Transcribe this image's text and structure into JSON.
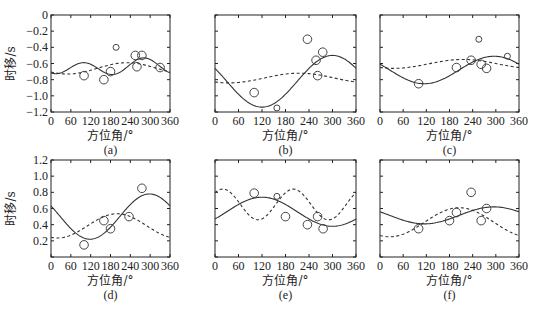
{
  "chart_data": [
    {
      "id": "a",
      "type": "scatter",
      "panel_label": "(a)",
      "xlabel": "方位角/°",
      "ylabel": "时移/s",
      "xlim": [
        0,
        360
      ],
      "ylim": [
        -1.2,
        0
      ],
      "xticks": [
        0,
        60,
        120,
        180,
        240,
        300,
        360
      ],
      "xtick_labels": [
        "0",
        "60",
        "120",
        "180",
        "240",
        "300",
        "360"
      ],
      "yticks": [
        0,
        -0.2,
        -0.4,
        -0.6,
        -0.8,
        -1.0,
        -1.2
      ],
      "ytick_labels": [
        "0",
        "-0.2",
        "-0.4",
        "-0.6",
        "-0.8",
        "-1.0",
        "-1.2"
      ],
      "show_ylabel": true,
      "show_yticklabels": true,
      "points": [
        {
          "x": 100,
          "y": -0.75,
          "size": "large"
        },
        {
          "x": 160,
          "y": -0.8,
          "size": "large"
        },
        {
          "x": 180,
          "y": -0.7,
          "size": "large"
        },
        {
          "x": 197,
          "y": -0.4,
          "size": "small"
        },
        {
          "x": 255,
          "y": -0.5,
          "size": "large"
        },
        {
          "x": 260,
          "y": -0.64,
          "size": "large"
        },
        {
          "x": 275,
          "y": -0.5,
          "size": "large"
        },
        {
          "x": 330,
          "y": -0.65,
          "size": "large"
        }
      ],
      "solid_curve": {
        "offset": -0.645,
        "amp": 0.085,
        "phase_deg": 280,
        "period_deg": 180,
        "amp2": 0.03,
        "phase2_deg": 290
      },
      "dashed_curve": {
        "offset": -0.66,
        "amp": 0.07,
        "phase_deg": 230,
        "period_deg": 360
      }
    },
    {
      "id": "b",
      "type": "scatter",
      "panel_label": "(b)",
      "xlabel": "方位角/°",
      "ylabel": "时移/s",
      "xlim": [
        0,
        360
      ],
      "ylim": [
        -1.2,
        0
      ],
      "xticks": [
        0,
        60,
        120,
        180,
        240,
        300,
        360
      ],
      "xtick_labels": [
        "0",
        "60",
        "120",
        "180",
        "240",
        "300",
        "360"
      ],
      "yticks": [
        0,
        -0.2,
        -0.4,
        -0.6,
        -0.8,
        -1.0,
        -1.2
      ],
      "ytick_labels": [],
      "show_ylabel": false,
      "show_yticklabels": false,
      "points": [
        {
          "x": 100,
          "y": -0.96,
          "size": "large"
        },
        {
          "x": 158,
          "y": -1.15,
          "size": "small"
        },
        {
          "x": 236,
          "y": -0.3,
          "size": "large"
        },
        {
          "x": 258,
          "y": -0.56,
          "size": "large"
        },
        {
          "x": 262,
          "y": -0.75,
          "size": "large"
        },
        {
          "x": 275,
          "y": -0.46,
          "size": "large"
        }
      ],
      "solid_curve": {
        "offset": -0.82,
        "amp": 0.32,
        "phase_deg": 300,
        "period_deg": 360
      },
      "dashed_curve": {
        "offset": -0.78,
        "amp": 0.06,
        "phase_deg": 215,
        "period_deg": 360
      }
    },
    {
      "id": "c",
      "type": "scatter",
      "panel_label": "(c)",
      "xlabel": "方位角/°",
      "ylabel": "时移/s",
      "xlim": [
        0,
        360
      ],
      "ylim": [
        -1.2,
        0
      ],
      "xticks": [
        0,
        60,
        120,
        180,
        240,
        300,
        360
      ],
      "xtick_labels": [
        "0",
        "60",
        "120",
        "180",
        "240",
        "300",
        "360"
      ],
      "yticks": [
        0,
        -0.2,
        -0.4,
        -0.6,
        -0.8,
        -1.0,
        -1.2
      ],
      "ytick_labels": [],
      "show_ylabel": false,
      "show_yticklabels": false,
      "points": [
        {
          "x": 100,
          "y": -0.85,
          "size": "large"
        },
        {
          "x": 198,
          "y": -0.65,
          "size": "large"
        },
        {
          "x": 236,
          "y": -0.56,
          "size": "large"
        },
        {
          "x": 256,
          "y": -0.3,
          "size": "small"
        },
        {
          "x": 262,
          "y": -0.61,
          "size": "large"
        },
        {
          "x": 276,
          "y": -0.66,
          "size": "large"
        },
        {
          "x": 330,
          "y": -0.51,
          "size": "small"
        }
      ],
      "solid_curve": {
        "offset": -0.68,
        "amp": 0.17,
        "phase_deg": 295,
        "period_deg": 360
      },
      "dashed_curve": {
        "offset": -0.605,
        "amp": 0.055,
        "phase_deg": 215,
        "period_deg": 360
      }
    },
    {
      "id": "d",
      "type": "scatter",
      "panel_label": "(d)",
      "xlabel": "方位角/°",
      "ylabel": "时移/s",
      "xlim": [
        0,
        360
      ],
      "ylim": [
        0,
        1.2
      ],
      "xticks": [
        0,
        60,
        120,
        180,
        240,
        300,
        360
      ],
      "xtick_labels": [
        "0",
        "60",
        "120",
        "180",
        "240",
        "300",
        "360"
      ],
      "yticks": [
        0,
        0.2,
        0.4,
        0.6,
        0.8,
        1.0,
        1.2
      ],
      "ytick_labels": [
        "",
        "0.2",
        "0.4",
        "0.6",
        "0.8",
        "1.0",
        "1.2"
      ],
      "show_ylabel": true,
      "show_yticklabels": true,
      "points": [
        {
          "x": 100,
          "y": 0.15,
          "size": "large"
        },
        {
          "x": 160,
          "y": 0.45,
          "size": "large"
        },
        {
          "x": 180,
          "y": 0.35,
          "size": "large"
        },
        {
          "x": 236,
          "y": 0.5,
          "size": "large"
        },
        {
          "x": 275,
          "y": 0.85,
          "size": "large"
        }
      ],
      "solid_curve": {
        "offset": 0.5,
        "amp": 0.28,
        "phase_deg": 298,
        "period_deg": 360
      },
      "dashed_curve": {
        "offset": 0.385,
        "amp": 0.15,
        "phase_deg": 200,
        "period_deg": 360
      }
    },
    {
      "id": "e",
      "type": "scatter",
      "panel_label": "(e)",
      "xlabel": "方位角/°",
      "ylabel": "时移/s",
      "xlim": [
        0,
        360
      ],
      "ylim": [
        0,
        1.2
      ],
      "xticks": [
        0,
        60,
        120,
        180,
        240,
        300,
        360
      ],
      "xtick_labels": [
        "0",
        "60",
        "120",
        "180",
        "240",
        "300",
        "360"
      ],
      "yticks": [
        0,
        0.2,
        0.4,
        0.6,
        0.8,
        1.0,
        1.2
      ],
      "ytick_labels": [],
      "show_ylabel": false,
      "show_yticklabels": false,
      "points": [
        {
          "x": 100,
          "y": 0.79,
          "size": "large"
        },
        {
          "x": 158,
          "y": 0.75,
          "size": "small"
        },
        {
          "x": 180,
          "y": 0.5,
          "size": "large"
        },
        {
          "x": 236,
          "y": 0.4,
          "size": "large"
        },
        {
          "x": 262,
          "y": 0.5,
          "size": "large"
        },
        {
          "x": 276,
          "y": 0.35,
          "size": "large"
        }
      ],
      "solid_curve": {
        "offset": 0.56,
        "amp": 0.18,
        "phase_deg": 120,
        "period_deg": 360
      },
      "dashed_curve": {
        "offset": 0.65,
        "amp": 0.19,
        "phase_deg": 20,
        "period_deg": 180
      }
    },
    {
      "id": "f",
      "type": "scatter",
      "panel_label": "(f)",
      "xlabel": "方位角/°",
      "ylabel": "时移/s",
      "xlim": [
        0,
        360
      ],
      "ylim": [
        0,
        1.2
      ],
      "xticks": [
        0,
        60,
        120,
        180,
        240,
        300,
        360
      ],
      "xtick_labels": [
        "0",
        "60",
        "120",
        "180",
        "240",
        "300",
        "360"
      ],
      "yticks": [
        0,
        0.2,
        0.4,
        0.6,
        0.8,
        1.0,
        1.2
      ],
      "ytick_labels": [],
      "show_ylabel": false,
      "show_yticklabels": false,
      "points": [
        {
          "x": 100,
          "y": 0.35,
          "size": "large"
        },
        {
          "x": 180,
          "y": 0.45,
          "size": "large"
        },
        {
          "x": 198,
          "y": 0.55,
          "size": "large"
        },
        {
          "x": 236,
          "y": 0.8,
          "size": "large"
        },
        {
          "x": 262,
          "y": 0.45,
          "size": "large"
        },
        {
          "x": 276,
          "y": 0.6,
          "size": "large"
        }
      ],
      "solid_curve": {
        "offset": 0.515,
        "amp": 0.105,
        "phase_deg": 295,
        "period_deg": 360
      },
      "dashed_curve": {
        "offset": 0.43,
        "amp": 0.18,
        "phase_deg": 205,
        "period_deg": 360
      }
    }
  ]
}
